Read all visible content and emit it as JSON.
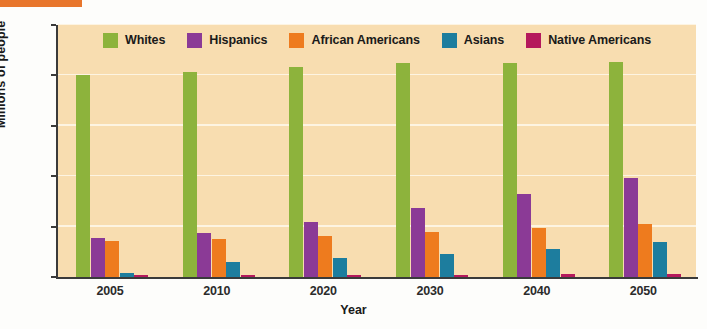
{
  "chart_data": {
    "type": "bar",
    "title": "",
    "xlabel": "Year",
    "ylabel": "Millions of people",
    "categories": [
      "2005",
      "2010",
      "2020",
      "2030",
      "2040",
      "2050"
    ],
    "ylim": [
      0,
      250
    ],
    "yticks": [
      0,
      50,
      100,
      150,
      200,
      250
    ],
    "ytick_labels": [
      "0",
      "50",
      "100",
      "150",
      "200",
      "250"
    ],
    "grid": true,
    "legend_position": "top-center",
    "series": [
      {
        "name": "Whites",
        "color": "#8DB33C",
        "values": [
          200,
          203,
          208,
          212,
          212,
          213
        ]
      },
      {
        "name": "Hispanics",
        "color": "#8B3A96",
        "values": [
          39,
          44,
          55,
          68,
          82,
          98
        ]
      },
      {
        "name": "African Americans",
        "color": "#EE7B1E",
        "values": [
          36,
          38,
          41,
          45,
          49,
          53
        ]
      },
      {
        "name": "Asians",
        "color": "#1D7D9E",
        "values": [
          4,
          15,
          19,
          23,
          28,
          35
        ]
      },
      {
        "name": "Native Americans",
        "color": "#B5195C",
        "values": [
          2,
          2,
          2,
          2,
          3,
          3
        ]
      }
    ]
  },
  "style": {
    "plot_background": "#f8ddb0",
    "page_background": "#fdfdfb",
    "gridline_color": "#fdf4e2",
    "axis_color": "#3a3a3a",
    "accent_rule": "#e8762c"
  }
}
